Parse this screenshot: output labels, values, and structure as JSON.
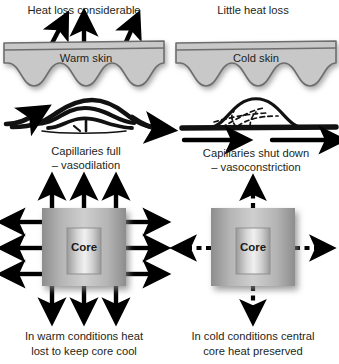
{
  "figure": {
    "background_color": "#ffffff",
    "text_color": "#231f20",
    "skin_fill": "#c8c8c8",
    "skin_stroke": "#6b6b6b",
    "arrow_color": "#000000",
    "core_box_edge": "#8d8d8d",
    "core_box_center": "#d8d8d8",
    "core_inner_edge": "#9a9a9a",
    "core_inner_center": "#ececec"
  },
  "panels": {
    "left": {
      "id": "warm",
      "heading": "Heat loss considerable",
      "skin_label": "Warm skin",
      "capillary_caption_line1": "Capillaries full",
      "capillary_caption_line2": "– vasodilation",
      "core_label": "Core",
      "footer_line1": "In warm conditions heat",
      "footer_line2": "lost to keep core cool",
      "heat_arrows_count": 3,
      "heat_arrow_style": "solid",
      "core_arrows_per_side": 3,
      "core_arrow_style": "solid",
      "capillary_state": "dilated"
    },
    "right": {
      "id": "cold",
      "heading": "Little heat loss",
      "skin_label": "Cold skin",
      "capillary_caption_line1": "Capillaries shut down",
      "capillary_caption_line2": "– vasoconstriction",
      "core_label": "Core",
      "footer_line1": "In cold conditions central",
      "footer_line2": "core heat preserved",
      "heat_arrows_count": 0,
      "heat_arrow_style": "none",
      "core_arrows_per_side": 1,
      "core_arrow_style": "dashed",
      "capillary_state": "constricted"
    }
  }
}
